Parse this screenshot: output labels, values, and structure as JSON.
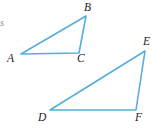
{
  "figure": {
    "background_color": "#ffffff",
    "stroke_color": "#55AEDC",
    "label_color": "#1a1a1a",
    "stroke_width": 1.6,
    "width": 158,
    "height": 133,
    "margin_fragment": {
      "text": "s",
      "x": 0,
      "y": 18,
      "color": "#8d8d8d"
    },
    "shapes": [
      {
        "name": "triangle-abc",
        "points": "21,54 86,16 79,53",
        "vertices": [
          {
            "id": "A",
            "label": "A",
            "px": 21,
            "py": 54,
            "label_x": 7,
            "label_y": 53
          },
          {
            "id": "B",
            "label": "B",
            "px": 86,
            "py": 16,
            "label_x": 84,
            "label_y": 2
          },
          {
            "id": "C",
            "label": "C",
            "px": 79,
            "py": 53,
            "label_x": 77,
            "label_y": 53
          }
        ]
      },
      {
        "name": "triangle-def",
        "points": "50,110 145,51 136,110",
        "vertices": [
          {
            "id": "D",
            "label": "D",
            "px": 50,
            "py": 110,
            "label_x": 38,
            "label_y": 112
          },
          {
            "id": "E",
            "label": "E",
            "px": 145,
            "py": 51,
            "label_x": 143,
            "label_y": 36
          },
          {
            "id": "F",
            "label": "F",
            "px": 136,
            "py": 110,
            "label_x": 135,
            "label_y": 112
          }
        ]
      }
    ]
  }
}
